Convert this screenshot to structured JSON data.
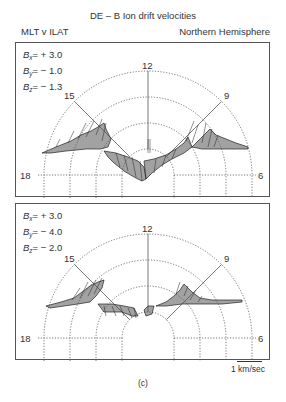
{
  "figure": {
    "title": "DE – B Ion drift velocities",
    "coords_label": "MLT v ILAT",
    "hemisphere_label": "Northern Hemisphere",
    "caption": "(c)",
    "scale": {
      "label": "1 km/sec"
    }
  },
  "panels": [
    {
      "params": [
        {
          "sym": "B",
          "sub": "x",
          "value": "= + 3.0"
        },
        {
          "sym": "B",
          "sub": "y",
          "value": "= − 1.0"
        },
        {
          "sym": "B",
          "sub": "z",
          "value": "= − 1.3"
        }
      ],
      "mlt_labels": {
        "top": "12",
        "upper_left": "15",
        "upper_right": "9",
        "left": "18",
        "right": "6"
      }
    },
    {
      "params": [
        {
          "sym": "B",
          "sub": "x",
          "value": "= + 3.0"
        },
        {
          "sym": "B",
          "sub": "y",
          "value": "= − 4.0"
        },
        {
          "sym": "B",
          "sub": "z",
          "value": "= − 2.0"
        }
      ],
      "mlt_labels": {
        "top": "12",
        "upper_left": "15",
        "upper_right": "9",
        "left": "18",
        "right": "6"
      }
    }
  ],
  "colors": {
    "ink": "#333333",
    "grid": "#555555",
    "background": "#ffffff"
  }
}
